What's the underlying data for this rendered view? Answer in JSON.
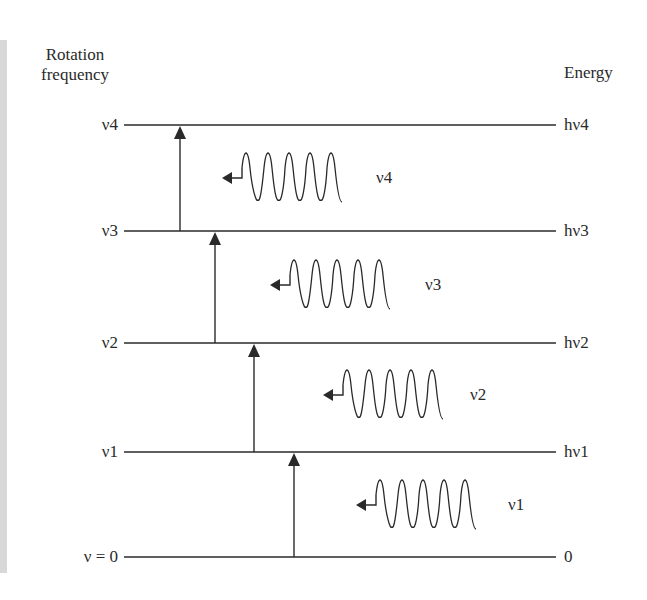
{
  "diagram": {
    "left_axis_title": [
      "Rotation",
      "frequency"
    ],
    "right_axis_title": "Energy",
    "levels": [
      {
        "left_label": "ν4",
        "right_label": "hν4",
        "y": 125
      },
      {
        "left_label": "ν3",
        "right_label": "hν3",
        "y": 231
      },
      {
        "left_label": "ν2",
        "right_label": "hν2",
        "y": 343
      },
      {
        "left_label": "ν1",
        "right_label": "hν1",
        "y": 452
      },
      {
        "left_label": "ν = 0",
        "right_label": "0",
        "y": 557
      }
    ],
    "transitions": [
      {
        "from": "ν3",
        "to": "ν4",
        "x": 180
      },
      {
        "from": "ν2",
        "to": "ν3",
        "x": 215
      },
      {
        "from": "ν1",
        "to": "ν2",
        "x": 254
      },
      {
        "from": "ν = 0",
        "to": "ν1",
        "x": 294
      }
    ],
    "emissions": [
      {
        "label": "ν4",
        "cx": 222,
        "cy": 178
      },
      {
        "label": "ν3",
        "cx": 270,
        "cy": 285
      },
      {
        "label": "ν2",
        "cx": 323,
        "cy": 395
      },
      {
        "label": "ν1",
        "cx": 356,
        "cy": 505
      }
    ],
    "colors": {
      "line": "#2a2a2a",
      "side_bar": "#d8d8d8"
    }
  }
}
